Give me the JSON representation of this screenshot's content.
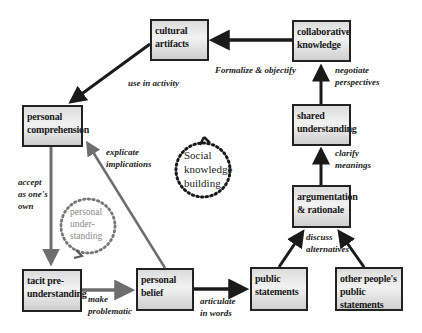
{
  "diagram": {
    "boxes": {
      "cultural_artifacts": {
        "line1": "cultural",
        "line2": "artifacts"
      },
      "collaborative_knowledge": {
        "line1": "collaborative",
        "line2": "knowledge"
      },
      "personal_comprehension": {
        "line1": "personal",
        "line2": "comprehension"
      },
      "shared_understanding": {
        "line1": "shared",
        "line2": "understanding"
      },
      "argumentation_rationale": {
        "line1": "argumentation",
        "line2": "& rationale"
      },
      "tacit_preunderstanding": {
        "line1": "tacit pre-",
        "line2": "understanding"
      },
      "personal_belief": {
        "line1": "personal",
        "line2": "belief"
      },
      "public_statements": {
        "line1": "public",
        "line2": "statements"
      },
      "other_public_statements": {
        "line1": "other people's",
        "line2": "public statements"
      }
    },
    "edge_labels": {
      "use_in_activity": {
        "line1": "use in activity"
      },
      "formalize_objectify": {
        "line1": "Formalize & objectify"
      },
      "negotiate_perspectives": {
        "line1": "negotiate",
        "line2": "perspectives"
      },
      "explicate_implications": {
        "line1": "explicate",
        "line2": "implications"
      },
      "clarify_meanings": {
        "line1": "clarify",
        "line2": "meanings"
      },
      "accept_as_own": {
        "line1": "accept",
        "line2": "as one's",
        "line3": "own"
      },
      "discuss_alternatives": {
        "line1": "discuss",
        "line2": "alternatives"
      },
      "make_problematic": {
        "line1": "make",
        "line2": "problematic"
      },
      "articulate_in_words": {
        "line1": "articulate",
        "line2": "in words"
      }
    },
    "cycles": {
      "social": {
        "line1": "Social",
        "line2": "knowledge",
        "line3": "building"
      },
      "personal": {
        "line1": "personal",
        "line2": "under-",
        "line3": "standing"
      }
    },
    "colors": {
      "dark_arrow": "#1a1a1a",
      "gray_arrow": "#6e6e6e",
      "box_border": "#222222"
    }
  }
}
